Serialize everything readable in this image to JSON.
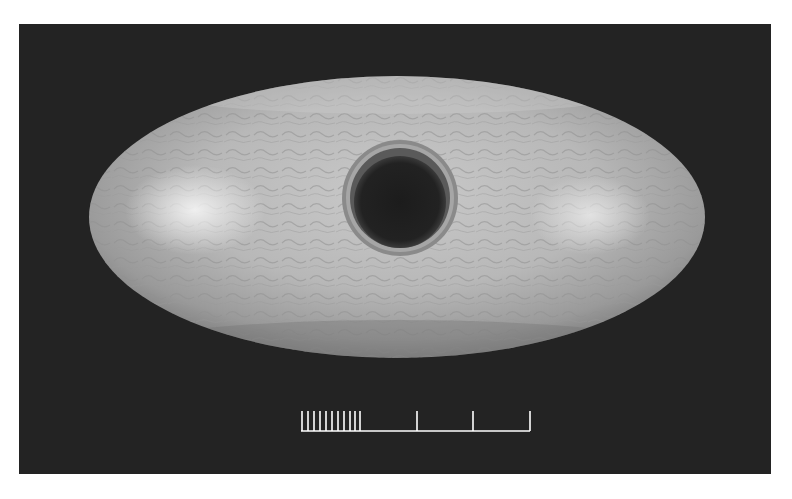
{
  "image": {
    "subject": "perforated polished stone object (elliptical, with central shaft hole)",
    "background_color": "#ffffff",
    "panel_color": "#232323",
    "object_color": "#b9b9b9",
    "object_highlight": "#e6e6e6",
    "hole_color": "#1e1e1e"
  },
  "scale_bar": {
    "fine_ticks": 10,
    "major_ticks": 3,
    "color": "#ffffff"
  }
}
